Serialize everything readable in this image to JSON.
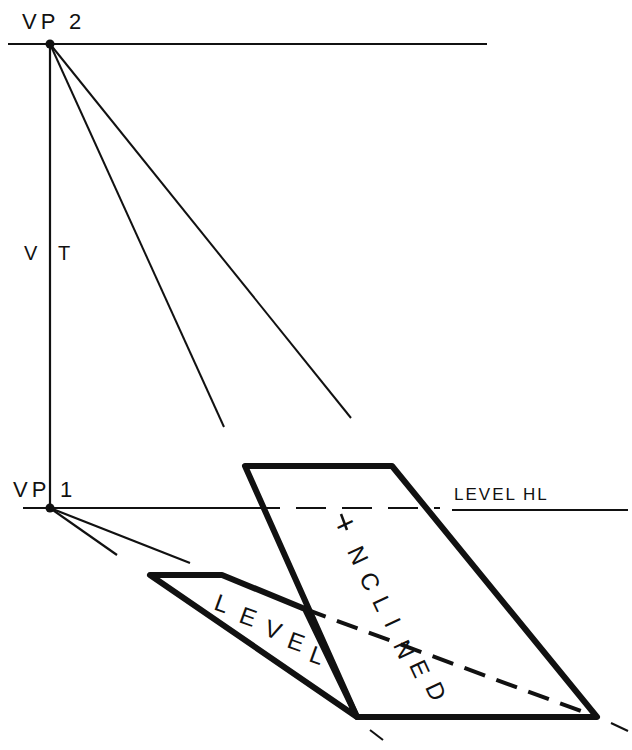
{
  "diagram": {
    "labels": {
      "vp2": "VP 2",
      "vp1": "VP 1",
      "vt_v": "V",
      "vt_t": "T",
      "level_hl": "LEVEL HL",
      "level_plane": [
        "L",
        "E",
        "V",
        "E",
        "L"
      ],
      "inclined_plane": [
        "I",
        "N",
        "C",
        "L",
        "I",
        "N",
        "E",
        "D"
      ]
    },
    "colors": {
      "ink": "#111111",
      "background": "#ffffff"
    }
  }
}
